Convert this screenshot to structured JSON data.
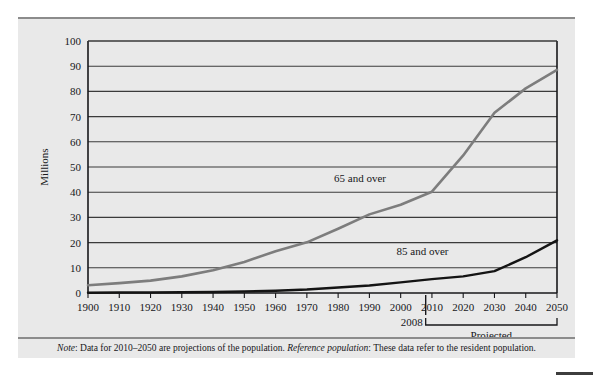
{
  "figure": {
    "note_lead": "Note",
    "note_text_1": ": Data for 2010–2050 are projections of the population. ",
    "note_lead_2": "Reference population",
    "note_text_2": ": These data refer to the resident population.",
    "projected_label": "Projected",
    "marker_year_label": "2008",
    "line_color_65": "#7d7d7d",
    "line_color_85": "#141414",
    "background": "#e9e9e9",
    "grid_color": "#3b3b3b"
  },
  "chart_data": {
    "type": "line",
    "title": "",
    "xlabel": "",
    "ylabel": "Millions",
    "ylim": [
      0,
      100
    ],
    "xlim": [
      1900,
      2050
    ],
    "ytick_step": 10,
    "grid": true,
    "legend_position": "inline-labels",
    "x": [
      1900,
      1910,
      1920,
      1930,
      1940,
      1950,
      1960,
      1970,
      1980,
      1990,
      2000,
      2010,
      2020,
      2030,
      2040,
      2050
    ],
    "yticks": [
      0,
      10,
      20,
      30,
      40,
      50,
      60,
      70,
      80,
      90,
      100
    ],
    "xticks": [
      1900,
      1910,
      1920,
      1930,
      1940,
      1950,
      1960,
      1970,
      1980,
      1990,
      2000,
      2010,
      2020,
      2030,
      2040,
      2050
    ],
    "series": [
      {
        "name": "65 and over",
        "color": "#7d7d7d",
        "label_x": 1987,
        "label_y": 44,
        "values": [
          3.1,
          3.9,
          4.9,
          6.6,
          9.0,
          12.3,
          16.6,
          20.1,
          25.5,
          31.2,
          35.0,
          40.2,
          54.6,
          71.5,
          81.2,
          88.5
        ]
      },
      {
        "name": "85 and over",
        "color": "#141414",
        "label_x": 2007,
        "label_y": 15,
        "values": [
          0.1,
          0.2,
          0.2,
          0.3,
          0.4,
          0.6,
          0.9,
          1.4,
          2.2,
          3.0,
          4.2,
          5.5,
          6.6,
          8.7,
          14.2,
          20.9
        ]
      }
    ],
    "annotations": [
      {
        "name": "projection-divider",
        "x": 2008,
        "label": "2008"
      },
      {
        "name": "projected-bracket",
        "from": 2010,
        "to": 2050,
        "label": "Projected"
      }
    ]
  }
}
